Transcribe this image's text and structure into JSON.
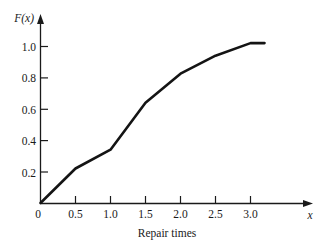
{
  "chart_data": {
    "type": "line",
    "title": "",
    "subtitle": "",
    "xlabel": "Repair times",
    "ylabel": "F(x)",
    "x_axis_symbol": "x",
    "y_axis_symbol": "F(x)",
    "xlim": [
      0,
      3.25
    ],
    "ylim": [
      0,
      1.1
    ],
    "grid": false,
    "legend": null,
    "x_ticks": [
      0,
      0.5,
      1.0,
      1.5,
      2.0,
      2.5,
      3.0
    ],
    "x_tick_labels": [
      "0",
      "0.5",
      "1.0",
      "1.5",
      "2.0",
      "2.5",
      "3.0"
    ],
    "y_ticks": [
      0,
      0.2,
      0.4,
      0.6,
      0.8,
      1.0
    ],
    "y_tick_labels": [
      "0",
      "0.2",
      "0.4",
      "0.6",
      "0.8",
      "1.0"
    ],
    "series": [
      {
        "name": "F(x)",
        "color": "#141414",
        "x": [
          0.0,
          0.5,
          1.0,
          1.5,
          2.0,
          2.5,
          3.0,
          3.2
        ],
        "values": [
          0.0,
          0.22,
          0.34,
          0.64,
          0.825,
          0.94,
          1.02,
          1.02
        ]
      }
    ],
    "annotations": []
  },
  "axis": {
    "y_label": "F(x)",
    "x_label": "x",
    "caption": "Repair times"
  },
  "colors": {
    "curve": "#141414",
    "axis": "#1a1a1a",
    "background": "#ffffff"
  }
}
